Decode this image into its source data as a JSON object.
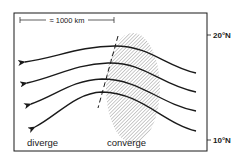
{
  "diagram": {
    "scale_label": "≈ 1000 km",
    "lat_top": "20°N",
    "lat_bottom": "10°N",
    "left_label": "diverge",
    "right_label": "converge",
    "colors": {
      "ink": "#1a1a1a",
      "hatch": "#8a8a8a",
      "background": "#ffffff"
    },
    "streamlines": [
      {
        "id": 1,
        "direction": "westward"
      },
      {
        "id": 2,
        "direction": "westward"
      },
      {
        "id": 3,
        "direction": "westward"
      },
      {
        "id": 4,
        "direction": "westward"
      }
    ]
  }
}
